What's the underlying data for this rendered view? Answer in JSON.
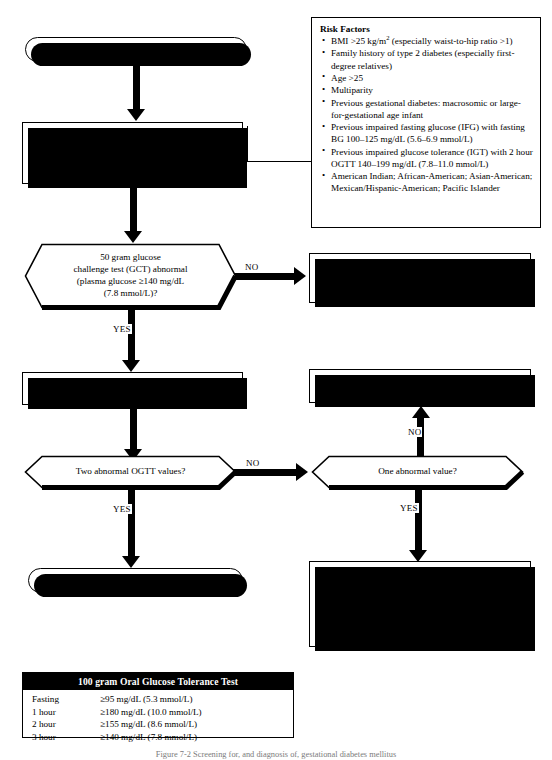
{
  "diagram": {
    "start": {
      "label": "Patient is pregnant"
    },
    "screening_box": {
      "line1_bold": "With risk factors:",
      "line1_rest": " screen at first prenatal visit",
      "line2_bold": "No risk factors:",
      "line2_rest": " screen at 24–28th gestational week",
      "line3": "Screen with 50 gram glucose challenge test (GCT)"
    },
    "risk_factors": {
      "title": "Risk Factors",
      "items": [
        "BMI >25 kg/m2 (especially waist-to-hip ratio >1)",
        "Family history of type 2 diabetes (especially first-degree relatives)",
        "Age >25",
        "Multiparity",
        "Previous gestational diabetes: macrosomic or large-for-gestational age infant",
        "Previous impaired fasting glucose (IFG) with fasting BG 100–125 mg/dL (5.6–6.9 mmol/L)",
        "Previous impaired glucose tolerance (IGT) with 2 hour OGTT 140–199 mg/dL (7.8–11.0 mmol/L)",
        "American Indian; African-American; Asian-American; Mexican/Hispanic-American; Pacific Islander"
      ],
      "item1_pre": "BMI >25 kg/m",
      "item1_sup": "2",
      "item1_post": " (especially waist-to-hip ratio >1)"
    },
    "decision_gct": {
      "line1": "50 gram glucose",
      "line2": "challenge test (GCT) abnormal",
      "line3": "(plasma glucose ≥140 mg/dL",
      "line4": "(7.8 mmol/L)?"
    },
    "gct_no_box": {
      "line1_bold": "With risk factors:",
      "line1_rest": " rescreen at 24 and 32 weeks; if normal at 32 weeks, no further testing",
      "line2_bold": "No risk factors:",
      "line2_rest": " no further testing"
    },
    "ogtt_box": {
      "line1": "Perform 100 gram oral glucose tolerance test",
      "line2": "(OGTT) within 3 days of positive screen"
    },
    "repeat_ogtt_box": {
      "line1_bold": "With risk factors:",
      "line1_rest": " repeat OGTT at 32 weeks",
      "line2_bold": "No risk factors:",
      "line2_rest": " no further testing"
    },
    "decision_two_abnormal": {
      "label": "Two abnormal OGTT values?"
    },
    "decision_one_abnormal": {
      "label": "One abnormal value?"
    },
    "smbg_box": {
      "para1": "Use SMBG to monitor fasting and 2 hours after start of meal; start medical nutrition therapy",
      "para2": "If average fasting BG ≥95 mg/dL (5.3 mmol/L) or average 2 hour post-meal BG ≥120 mg/dL (6.7 mmol/L), consider repeat OGTT because pharmacologic therapy may be indicated"
    },
    "diagnosis": {
      "label": "Diagnosis of gestational diabetes"
    },
    "edge_labels": {
      "gct_no": "NO",
      "gct_yes": "YES",
      "two_no": "NO",
      "two_yes": "YES",
      "one_no": "NO",
      "one_yes": "YES"
    }
  },
  "ogtt_table": {
    "header": "100 gram Oral Glucose Tolerance Test",
    "rows": [
      {
        "label": "Fasting",
        "value": "≥95 mg/dL (5.3 mmol/L)"
      },
      {
        "label": "1 hour",
        "value": "≥180 mg/dL (10.0 mmol/L)"
      },
      {
        "label": "2 hour",
        "value": "≥155 mg/dL (8.6 mmol/L)"
      },
      {
        "label": "3 hour",
        "value": "≥140 mg/dL (7.8 mmol/L)"
      }
    ]
  },
  "caption": {
    "text": "Figure 7-2   Screening for, and diagnosis of, gestational diabetes mellitus"
  },
  "colors": {
    "ink": "#000000",
    "paper": "#ffffff",
    "table_header_bg": "#000000",
    "table_header_fg": "#ffffff",
    "caption_fg": "#7b7b7b"
  }
}
